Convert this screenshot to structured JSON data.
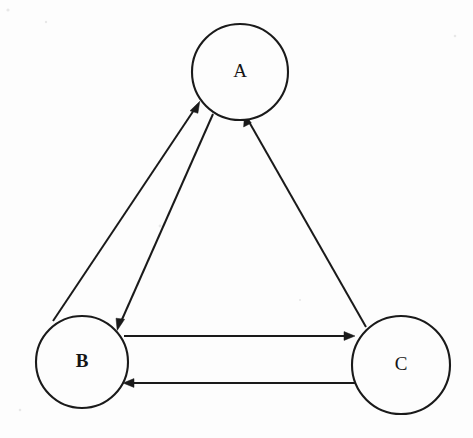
{
  "diagram": {
    "type": "directed-graph",
    "background_color": "#fdfdfd",
    "stroke_color": "#1a1a1a",
    "canvas": {
      "width": 473,
      "height": 438
    },
    "nodes": [
      {
        "id": "A",
        "label": "A",
        "cx": 240,
        "cy": 72,
        "r": 48,
        "label_weight": "normal"
      },
      {
        "id": "B",
        "label": "B",
        "cx": 82,
        "cy": 362,
        "r": 46,
        "label_weight": "bold"
      },
      {
        "id": "C",
        "label": "C",
        "cx": 401,
        "cy": 365,
        "r": 49,
        "label_weight": "normal"
      }
    ],
    "edges": [
      {
        "id": "b-to-a",
        "from": "B",
        "to": "A",
        "directed": true,
        "style": "straight",
        "description": "B to A, upper-left diagonal pair, arrow at A"
      },
      {
        "id": "a-to-b",
        "from": "A",
        "to": "B",
        "directed": true,
        "style": "straight",
        "description": "A to B, upper-left diagonal pair, arrow at B"
      },
      {
        "id": "b-to-c",
        "from": "B",
        "to": "C",
        "directed": true,
        "style": "straight",
        "description": "B to C, top horizontal line, arrow at C"
      },
      {
        "id": "c-to-b",
        "from": "C",
        "to": "B",
        "directed": true,
        "style": "straight",
        "description": "C to B, bottom horizontal line, arrow at B"
      },
      {
        "id": "c-to-a",
        "from": "C",
        "to": "A",
        "directed": true,
        "style": "straight",
        "description": "C to A, right diagonal, arrow at A"
      }
    ],
    "adjacency_summary": [
      "A <-> B (bidirectional, two parallel lines)",
      "B <-> C (bidirectional, two parallel lines)",
      "C -> A (unidirectional, single line)"
    ]
  }
}
